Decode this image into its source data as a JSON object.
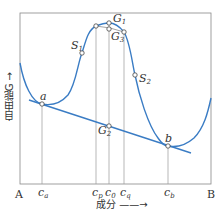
{
  "diagram": {
    "type": "free-energy-composition curve",
    "y_axis_label": "自由能G",
    "x_axis_label": "成分",
    "x_endpoints": {
      "left": "A",
      "right": "B"
    },
    "points": {
      "a": "a",
      "b": "b",
      "S1": "S",
      "S1_sub": "1",
      "S2": "S",
      "S2_sub": "2",
      "G1": "G",
      "G1_sub": "1",
      "G2": "G",
      "G2_sub": "2",
      "G3": "G",
      "G3_sub": "3"
    },
    "compositions": [
      {
        "main": "c",
        "sub": "a"
      },
      {
        "main": "c",
        "sub": "p"
      },
      {
        "main": "c",
        "sub": "0"
      },
      {
        "main": "c",
        "sub": "q"
      },
      {
        "main": "c",
        "sub": "b"
      }
    ],
    "colors": {
      "curve": "#3a7cc4",
      "tangent": "#3a7cc4",
      "frame": "#888888",
      "text": "#333333"
    }
  }
}
